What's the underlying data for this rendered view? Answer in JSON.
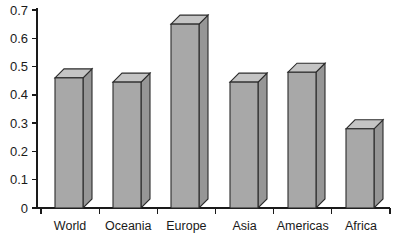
{
  "chart_data": {
    "type": "bar",
    "title": "",
    "subtitle": "",
    "xlabel": "",
    "ylabel": "",
    "categories": [
      "World",
      "Oceania",
      "Europe",
      "Asia",
      "Americas",
      "Africa"
    ],
    "values": [
      0.46,
      0.445,
      0.65,
      0.445,
      0.48,
      0.28
    ],
    "series": [
      {
        "name": "value",
        "values": [
          0.46,
          0.445,
          0.65,
          0.445,
          0.48,
          0.28
        ]
      }
    ],
    "ylim": [
      0,
      0.7
    ],
    "xlim": [
      0,
      6
    ],
    "ytick_labels": [
      "0",
      "0.1",
      "0.2",
      "0.3",
      "0.4",
      "0.5",
      "0.6",
      "0.7"
    ],
    "ytick_values": [
      0,
      0.1,
      0.2,
      0.3,
      0.4,
      0.5,
      0.6,
      0.7
    ],
    "grid": false,
    "legend": false,
    "legend_position": "none",
    "style": "3d-column",
    "annotations": []
  },
  "style": {
    "bar_front_color": "#a8a8a8",
    "bar_top_color": "#c4c4c4",
    "bar_side_color": "#969696",
    "bar_outline_color": "#2b2b2b",
    "axis_color": "#1a1a1a",
    "background_color": "#ffffff",
    "text_color": "#1a1a1a"
  },
  "axis": {
    "y_axis_name": "value-axis",
    "x_axis_name": "category-axis"
  }
}
